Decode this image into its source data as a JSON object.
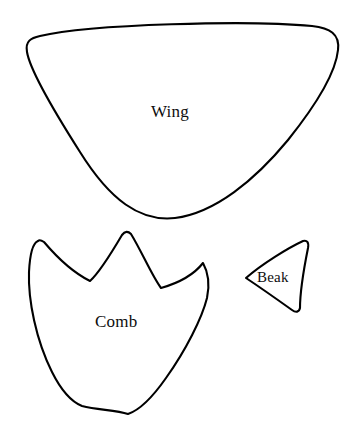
{
  "document": {
    "type": "craft-pattern-template",
    "title": "Bird Craft Pattern Pieces",
    "background_color": "#ffffff",
    "stroke_color": "#000000",
    "stroke_width_px": 2,
    "canvas": {
      "width": 355,
      "height": 443
    }
  },
  "pieces": [
    {
      "id": "wing",
      "label": "Wing",
      "shape": "rounded-triangle",
      "label_position": {
        "x": 151,
        "y": 103
      },
      "bounds": {
        "x": 26,
        "y": 22,
        "width": 315,
        "height": 198
      }
    },
    {
      "id": "comb",
      "label": "Comb",
      "shape": "three-point-crown",
      "label_position": {
        "x": 95,
        "y": 313
      },
      "bounds": {
        "x": 28,
        "y": 230,
        "width": 182,
        "height": 187
      }
    },
    {
      "id": "beak",
      "label": "Beak",
      "shape": "curved-triangle",
      "label_position": {
        "x": 257,
        "y": 270
      },
      "bounds": {
        "x": 244,
        "y": 240,
        "width": 65,
        "height": 73
      }
    }
  ]
}
